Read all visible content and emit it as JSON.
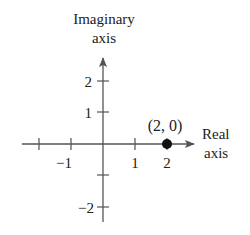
{
  "diagram": {
    "imag_axis_label": [
      "Imaginary",
      "axis"
    ],
    "real_axis_label": [
      "Real",
      "axis"
    ],
    "real_ticks": [
      {
        "value": -2,
        "label": ""
      },
      {
        "value": -1,
        "label": "−1"
      },
      {
        "value": 1,
        "label": "1"
      },
      {
        "value": 2,
        "label": "2"
      }
    ],
    "imag_ticks": [
      {
        "value": 2,
        "label": "2"
      },
      {
        "value": 1,
        "label": "1"
      },
      {
        "value": -1,
        "label": ""
      },
      {
        "value": -2,
        "label": "−2"
      }
    ],
    "point": {
      "x": 2,
      "y": 0,
      "label": "(2, 0)"
    },
    "colors": {
      "axis": "#444444",
      "point": "#111111",
      "text": "#222222"
    }
  }
}
